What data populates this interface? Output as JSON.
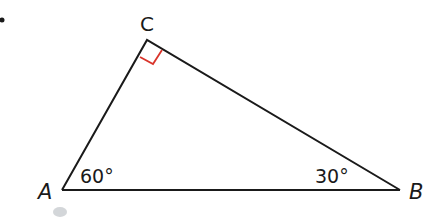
{
  "diagram": {
    "type": "right-triangle",
    "vertices": {
      "A": {
        "label": "A",
        "angle": "60°"
      },
      "B": {
        "label": "B",
        "angle": "30°"
      },
      "C": {
        "label": "C",
        "angle": "90°"
      }
    },
    "colors": {
      "line": "#1a1a1a",
      "right_angle_marker": "#d9342b",
      "smudge": "#c8ccd0"
    }
  }
}
